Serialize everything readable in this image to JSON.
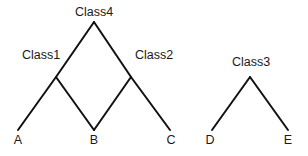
{
  "diagram": {
    "type": "hierarchy-lattice",
    "nodes": [
      {
        "id": "Class4",
        "label": "Class4",
        "x": 94,
        "y": 22,
        "label_x": 94,
        "label_y": 16
      },
      {
        "id": "Class1",
        "label": "Class1",
        "x": 56,
        "y": 77,
        "label_x": 41,
        "label_y": 59
      },
      {
        "id": "Class2",
        "label": "Class2",
        "x": 131,
        "y": 77,
        "label_x": 154,
        "label_y": 59
      },
      {
        "id": "Class3",
        "label": "Class3",
        "x": 250,
        "y": 77,
        "label_x": 251,
        "label_y": 66
      },
      {
        "id": "A",
        "label": "A",
        "x": 18,
        "y": 130,
        "label_x": 18,
        "label_y": 144
      },
      {
        "id": "B",
        "label": "B",
        "x": 94,
        "y": 130,
        "label_x": 94,
        "label_y": 144
      },
      {
        "id": "C",
        "label": "C",
        "x": 170,
        "y": 130,
        "label_x": 171,
        "label_y": 144
      },
      {
        "id": "D",
        "label": "D",
        "x": 212,
        "y": 130,
        "label_x": 210,
        "label_y": 144
      },
      {
        "id": "E",
        "label": "E",
        "x": 288,
        "y": 130,
        "label_x": 288,
        "label_y": 144
      }
    ],
    "edges": [
      {
        "from": "Class4",
        "to": "Class1"
      },
      {
        "from": "Class4",
        "to": "Class2"
      },
      {
        "from": "Class1",
        "to": "A"
      },
      {
        "from": "Class1",
        "to": "B"
      },
      {
        "from": "Class2",
        "to": "B"
      },
      {
        "from": "Class2",
        "to": "C"
      },
      {
        "from": "Class3",
        "to": "D"
      },
      {
        "from": "Class3",
        "to": "E"
      }
    ],
    "colors": {
      "line": "#111111",
      "text": "#1a1a1a",
      "background": "#ffffff"
    }
  }
}
